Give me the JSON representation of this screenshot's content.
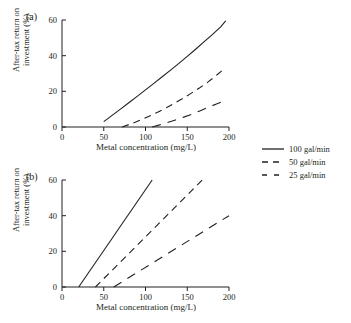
{
  "figure": {
    "panels": [
      {
        "tag": "(a)",
        "xlabel": "Metal concentration (mg/L)",
        "ylabel_line1": "After-tax return on",
        "ylabel_line2": "investment (%)",
        "xticks": [
          "0",
          "50",
          "100",
          "150",
          "200"
        ],
        "yticks": [
          "0",
          "20",
          "40",
          "60"
        ]
      },
      {
        "tag": "(b)",
        "xlabel": "Metal concentration (mg/L)",
        "ylabel_line1": "After-tax return on",
        "ylabel_line2": "investment (%)",
        "xticks": [
          "0",
          "50",
          "100",
          "150",
          "200"
        ],
        "yticks": [
          "0",
          "20",
          "40",
          "60"
        ]
      }
    ]
  },
  "legend": {
    "items": [
      {
        "label": "100 gal/min",
        "style": "solid",
        "dash": "none"
      },
      {
        "label": "50 gal/min",
        "style": "dashed",
        "dash": "7,5"
      },
      {
        "label": "25 gal/min",
        "style": "long-dashed",
        "dash": "9,7"
      }
    ]
  },
  "chart_data": [
    {
      "type": "line",
      "title": "(a)",
      "xlabel": "Metal concentration (mg/L)",
      "ylabel": "After-tax return on investment (%)",
      "xlim": [
        0,
        200
      ],
      "ylim": [
        0,
        60
      ],
      "xticks": [
        0,
        50,
        100,
        150,
        200
      ],
      "yticks": [
        0,
        20,
        40,
        60
      ],
      "grid": false,
      "legend_position": "right-outside",
      "series": [
        {
          "name": "100 gal/min",
          "style": "solid",
          "x": [
            50,
            60,
            70,
            80,
            90,
            100,
            110,
            120,
            130,
            140,
            150,
            160,
            170,
            180,
            190,
            196
          ],
          "y": [
            3.0,
            6.5,
            10.0,
            13.6,
            17.2,
            20.8,
            24.5,
            28.2,
            31.9,
            35.7,
            39.6,
            43.6,
            47.7,
            51.8,
            56.2,
            59.5
          ]
        },
        {
          "name": "50 gal/min",
          "style": "dashed",
          "x": [
            72,
            85,
            95,
            105,
            115,
            125,
            135,
            145,
            155,
            165,
            175,
            185,
            195
          ],
          "y": [
            0.0,
            2.2,
            4.1,
            6.2,
            8.4,
            10.8,
            13.4,
            16.1,
            19.0,
            22.0,
            25.3,
            29.0,
            33.0
          ]
        },
        {
          "name": "25 gal/min",
          "style": "long-dashed",
          "x": [
            108,
            115,
            125,
            135,
            145,
            155,
            165,
            175,
            185,
            195
          ],
          "y": [
            0.0,
            0.9,
            2.3,
            3.8,
            5.4,
            7.1,
            9.0,
            11.0,
            12.9,
            14.7
          ]
        }
      ]
    },
    {
      "type": "line",
      "title": "(b)",
      "xlabel": "Metal concentration (mg/L)",
      "ylabel": "After-tax return on investment (%)",
      "xlim": [
        0,
        200
      ],
      "ylim": [
        0,
        60
      ],
      "xticks": [
        0,
        50,
        100,
        150,
        200
      ],
      "yticks": [
        0,
        20,
        40,
        60
      ],
      "grid": false,
      "legend_position": "shared-with-panel-a",
      "series": [
        {
          "name": "100 gal/min",
          "style": "solid",
          "x": [
            20,
            108
          ],
          "y": [
            0,
            60
          ]
        },
        {
          "name": "50 gal/min",
          "style": "dashed",
          "x": [
            40,
            168
          ],
          "y": [
            0,
            60
          ]
        },
        {
          "name": "25 gal/min",
          "style": "long-dashed",
          "x": [
            62,
            200
          ],
          "y": [
            0,
            40
          ]
        }
      ]
    }
  ]
}
